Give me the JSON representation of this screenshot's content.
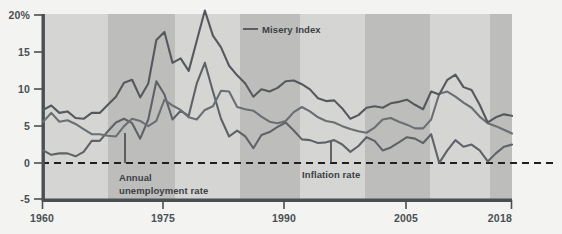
{
  "chart_data": {
    "type": "line",
    "title": "",
    "xlabel": "",
    "ylabel": "",
    "xlim": [
      1960,
      2018
    ],
    "ylim": [
      -5,
      20
    ],
    "ytick_labels": [
      "20%",
      "15",
      "10",
      "5",
      "0",
      "-5"
    ],
    "ytick_values": [
      20,
      15,
      10,
      5,
      0,
      -5
    ],
    "xtick_labels": [
      "1960",
      "1975",
      "1990",
      "2005",
      "2018"
    ],
    "xtick_values": [
      1960,
      1975,
      1990,
      2005,
      2018
    ],
    "grid": false,
    "zero_line": "dashed",
    "legend_position": "inline-annotations",
    "background_bands": "alternating light/dark grey vertical bands (decade shading)",
    "annotations": [
      {
        "name": "misery-index-label",
        "text": "Misery Index",
        "leader": "horizontal dash to series"
      },
      {
        "name": "unemployment-label",
        "text": "Annual\nunemployment rate",
        "leader": "vertical line to series"
      },
      {
        "name": "inflation-label",
        "text": "Inflation rate",
        "leader": "vertical line to series"
      }
    ],
    "x": [
      1960,
      1961,
      1962,
      1963,
      1964,
      1965,
      1966,
      1967,
      1968,
      1969,
      1970,
      1971,
      1972,
      1973,
      1974,
      1975,
      1976,
      1977,
      1978,
      1979,
      1980,
      1981,
      1982,
      1983,
      1984,
      1985,
      1986,
      1987,
      1988,
      1989,
      1990,
      1991,
      1992,
      1993,
      1994,
      1995,
      1996,
      1997,
      1998,
      1999,
      2000,
      2001,
      2002,
      2003,
      2004,
      2005,
      2006,
      2007,
      2008,
      2009,
      2010,
      2011,
      2012,
      2013,
      2014,
      2015,
      2016,
      2017,
      2018
    ],
    "series": [
      {
        "name": "Misery Index",
        "color": "#55595d",
        "values": [
          7.1,
          7.7,
          6.7,
          6.9,
          6.0,
          5.9,
          6.7,
          6.7,
          7.8,
          8.9,
          10.8,
          11.2,
          8.8,
          10.7,
          16.6,
          17.7,
          13.5,
          14.1,
          12.4,
          16.5,
          20.6,
          17.2,
          15.6,
          13.1,
          11.8,
          10.7,
          8.9,
          9.9,
          9.6,
          10.1,
          11.0,
          11.1,
          10.6,
          9.9,
          8.7,
          8.3,
          8.4,
          7.3,
          5.9,
          6.4,
          7.4,
          7.6,
          7.4,
          8.0,
          8.2,
          8.5,
          7.8,
          7.2,
          9.6,
          9.2,
          11.2,
          11.9,
          10.2,
          9.8,
          7.8,
          5.4,
          6.1,
          6.5,
          6.3
        ]
      },
      {
        "name": "Annual unemployment rate",
        "color": "#6a6f74",
        "values": [
          5.5,
          6.7,
          5.5,
          5.7,
          5.2,
          4.5,
          3.8,
          3.8,
          3.6,
          3.5,
          4.9,
          5.9,
          5.6,
          4.9,
          5.6,
          8.5,
          7.7,
          7.1,
          6.1,
          5.8,
          7.1,
          7.6,
          9.7,
          9.6,
          7.5,
          7.2,
          7.0,
          6.2,
          5.5,
          5.3,
          5.6,
          6.8,
          7.5,
          6.9,
          6.1,
          5.6,
          5.4,
          4.9,
          4.5,
          4.2,
          4.0,
          4.7,
          5.8,
          6.0,
          5.5,
          5.1,
          4.6,
          4.6,
          5.8,
          9.3,
          9.6,
          8.9,
          8.1,
          7.4,
          6.2,
          5.3,
          4.9,
          4.4,
          3.9
        ]
      },
      {
        "name": "Inflation rate",
        "color": "#5f6367",
        "values": [
          1.6,
          1.0,
          1.2,
          1.2,
          0.8,
          1.4,
          2.9,
          2.9,
          4.2,
          5.4,
          5.9,
          5.3,
          3.2,
          5.8,
          11.0,
          9.2,
          5.8,
          7.0,
          6.3,
          10.7,
          13.5,
          9.6,
          5.9,
          3.5,
          4.3,
          3.5,
          1.9,
          3.7,
          4.1,
          4.8,
          5.4,
          4.3,
          3.1,
          3.0,
          2.6,
          2.7,
          3.0,
          2.4,
          1.4,
          2.2,
          3.4,
          2.9,
          1.6,
          2.0,
          2.7,
          3.4,
          3.2,
          2.6,
          3.8,
          -0.1,
          1.6,
          3.0,
          2.1,
          2.4,
          1.6,
          0.1,
          1.2,
          2.1,
          2.4
        ]
      }
    ]
  },
  "axis": {
    "y_labels": [
      "20%",
      "15",
      "10",
      "5",
      "0",
      "-5"
    ],
    "x_labels": [
      "1960",
      "1975",
      "1990",
      "2005",
      "2018"
    ]
  },
  "labels": {
    "misery": "Misery Index",
    "unemployment_line1": "Annual",
    "unemployment_line2": "unemployment rate",
    "inflation": "Inflation rate"
  },
  "colors": {
    "band_light": "#d4d4d2",
    "band_dark": "#bcbcba",
    "axis": "#4a4f54",
    "line": "#5c6166",
    "text": "#3b4045",
    "page_bg": "#f3f3f1"
  }
}
